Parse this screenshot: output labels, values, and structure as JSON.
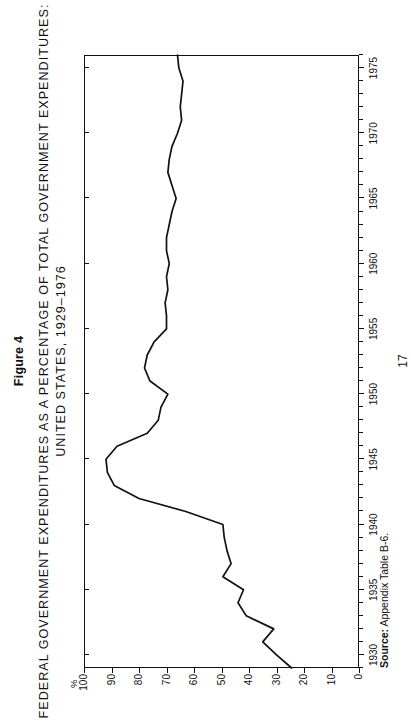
{
  "figure": {
    "number_label": "Figure 4",
    "title_line1": "FEDERAL GOVERNMENT EXPENDITURES AS A PERCENTAGE OF TOTAL GOVERNMENT EXPENDITURES:",
    "title_line2": "UNITED STATES, 1929–1976",
    "source": "Source: Appendix Table B-6.",
    "source_prefix": "Source:",
    "source_text": " Appendix Table B-6.",
    "page_number": "17",
    "unit_symbol": "%"
  },
  "chart_data": {
    "type": "line",
    "title": "FEDERAL GOVERNMENT EXPENDITURES AS A PERCENTAGE OF TOTAL GOVERNMENT EXPENDITURES: UNITED STATES, 1929–1976",
    "xlabel": "",
    "ylabel": "%",
    "xlim": [
      1929,
      1976
    ],
    "ylim": [
      0,
      100
    ],
    "ytick_labels": [
      "100",
      "90",
      "80",
      "70",
      "60",
      "50",
      "40",
      "30",
      "20",
      "10",
      "0"
    ],
    "ytick_values": [
      100,
      90,
      80,
      70,
      60,
      50,
      40,
      30,
      20,
      10,
      0
    ],
    "xtick_labels": [
      "1930",
      "1935",
      "1940",
      "1945",
      "1950",
      "1955",
      "1960",
      "1965",
      "1970",
      "1975"
    ],
    "xtick_values": [
      1930,
      1935,
      1940,
      1945,
      1950,
      1955,
      1960,
      1965,
      1970,
      1975
    ],
    "xminor_step": 1,
    "grid": false,
    "legend": false,
    "line_color": "#111111",
    "series": [
      {
        "name": "Federal share of total government expenditures",
        "x": [
          1929,
          1930,
          1931,
          1932,
          1933,
          1934,
          1935,
          1936,
          1937,
          1938,
          1939,
          1940,
          1941,
          1942,
          1943,
          1944,
          1945,
          1946,
          1947,
          1948,
          1949,
          1950,
          1951,
          1952,
          1953,
          1954,
          1955,
          1956,
          1957,
          1958,
          1959,
          1960,
          1961,
          1962,
          1963,
          1964,
          1965,
          1966,
          1967,
          1968,
          1969,
          1970,
          1971,
          1972,
          1973,
          1974,
          1975,
          1976
        ],
        "y": [
          24.5,
          30.0,
          35.0,
          31.0,
          41.0,
          44.0,
          42.0,
          49.5,
          46.5,
          48.0,
          49.0,
          49.5,
          63.0,
          80.0,
          89.0,
          91.5,
          92.0,
          88.0,
          77.0,
          73.0,
          72.0,
          69.5,
          76.0,
          78.0,
          77.0,
          74.5,
          70.0,
          70.0,
          70.5,
          69.5,
          70.0,
          69.0,
          70.0,
          70.0,
          69.0,
          68.0,
          66.5,
          68.0,
          69.5,
          69.0,
          68.0,
          66.0,
          64.5,
          65.0,
          64.5,
          64.0,
          65.5,
          66.0
        ]
      }
    ]
  }
}
